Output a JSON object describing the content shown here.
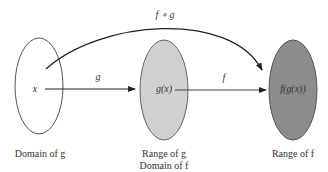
{
  "diagram": {
    "sets": [
      {
        "id": "domain-g",
        "element": "x",
        "caption": [
          "Domain of g"
        ],
        "fill": "#ffffff"
      },
      {
        "id": "range-g",
        "element": "g(x)",
        "caption": [
          "Range of g",
          "Domain of f"
        ],
        "fill": "#d0d0d0"
      },
      {
        "id": "range-f",
        "element": "f(g(x))",
        "caption": [
          "Range of f"
        ],
        "fill": "#8c8c8c"
      }
    ],
    "arrows": [
      {
        "from": "x",
        "to": "g(x)",
        "label": "g"
      },
      {
        "from": "g(x)",
        "to": "f(g(x))",
        "label": "f"
      },
      {
        "from": "x",
        "to": "f(g(x))",
        "label": "f ∘ g",
        "curved": true
      }
    ],
    "stroke_color": "#333333"
  }
}
